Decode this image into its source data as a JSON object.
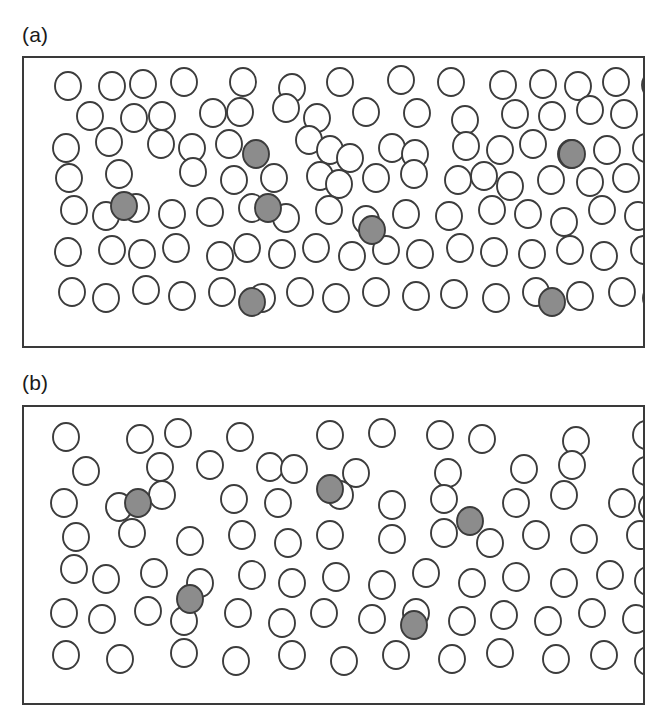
{
  "figure": {
    "background_color": "#ffffff",
    "width": 662,
    "height": 727
  },
  "style": {
    "open_circle_fill": "#ffffff",
    "filled_circle_fill": "#8c8c8c",
    "circle_stroke": "#3c3c3c",
    "frame_stroke": "#3a3a3a",
    "label_color": "#1a1a1a",
    "circle_radius_x": 13,
    "circle_radius_y": 14
  },
  "panels": [
    {
      "id": "panel-a",
      "label": "(a)",
      "label_x": 22,
      "label_y": 24,
      "frame": {
        "x": 22,
        "y": 56,
        "width": 623,
        "height": 292
      },
      "counts": {
        "open": 108,
        "filled": 6,
        "total": 114
      },
      "description": "High particle density field with six shaded particles"
    },
    {
      "id": "panel-b",
      "label": "(b)",
      "label_x": 22,
      "label_y": 372,
      "frame": {
        "x": 22,
        "y": 405,
        "width": 623,
        "height": 300
      },
      "counts": {
        "open": 80,
        "filled": 5,
        "total": 85
      },
      "description": "Lower particle density field with five shaded particles"
    }
  ],
  "chart_data": {
    "type": "scatter",
    "xlabel": "",
    "ylabel": "",
    "grid": false,
    "legend": null,
    "series": [
      {
        "name": "panel-a-open",
        "panel": "panel-a",
        "marker": "open-circle",
        "fill": "#ffffff",
        "stroke": "#3c3c3c",
        "points": [
          [
            44,
            28
          ],
          [
            88,
            28
          ],
          [
            119,
            26
          ],
          [
            160,
            24
          ],
          [
            219,
            24
          ],
          [
            268,
            30
          ],
          [
            316,
            24
          ],
          [
            377,
            22
          ],
          [
            427,
            24
          ],
          [
            479,
            27
          ],
          [
            519,
            26
          ],
          [
            554,
            28
          ],
          [
            592,
            24
          ],
          [
            631,
            27
          ],
          [
            66,
            58
          ],
          [
            110,
            60
          ],
          [
            138,
            58
          ],
          [
            189,
            55
          ],
          [
            216,
            54
          ],
          [
            262,
            50
          ],
          [
            293,
            60
          ],
          [
            342,
            54
          ],
          [
            393,
            55
          ],
          [
            441,
            62
          ],
          [
            491,
            56
          ],
          [
            528,
            58
          ],
          [
            566,
            52
          ],
          [
            600,
            56
          ],
          [
            636,
            60
          ],
          [
            42,
            90
          ],
          [
            85,
            84
          ],
          [
            137,
            86
          ],
          [
            168,
            90
          ],
          [
            205,
            86
          ],
          [
            232,
            96
          ],
          [
            285,
            82
          ],
          [
            306,
            92
          ],
          [
            326,
            100
          ],
          [
            368,
            90
          ],
          [
            391,
            96
          ],
          [
            442,
            88
          ],
          [
            476,
            92
          ],
          [
            509,
            86
          ],
          [
            547,
            96
          ],
          [
            583,
            92
          ],
          [
            622,
            90
          ],
          [
            45,
            120
          ],
          [
            95,
            116
          ],
          [
            169,
            114
          ],
          [
            210,
            122
          ],
          [
            250,
            120
          ],
          [
            296,
            118
          ],
          [
            315,
            126
          ],
          [
            352,
            120
          ],
          [
            390,
            116
          ],
          [
            434,
            122
          ],
          [
            460,
            118
          ],
          [
            486,
            128
          ],
          [
            527,
            122
          ],
          [
            566,
            124
          ],
          [
            602,
            120
          ],
          [
            636,
            126
          ],
          [
            50,
            152
          ],
          [
            82,
            158
          ],
          [
            112,
            150
          ],
          [
            148,
            156
          ],
          [
            186,
            154
          ],
          [
            228,
            150
          ],
          [
            262,
            160
          ],
          [
            305,
            152
          ],
          [
            342,
            162
          ],
          [
            382,
            156
          ],
          [
            425,
            158
          ],
          [
            468,
            152
          ],
          [
            504,
            156
          ],
          [
            540,
            164
          ],
          [
            578,
            152
          ],
          [
            614,
            158
          ],
          [
            638,
            162
          ],
          [
            44,
            194
          ],
          [
            88,
            192
          ],
          [
            118,
            196
          ],
          [
            152,
            190
          ],
          [
            196,
            198
          ],
          [
            223,
            190
          ],
          [
            258,
            196
          ],
          [
            292,
            190
          ],
          [
            328,
            198
          ],
          [
            362,
            192
          ],
          [
            396,
            196
          ],
          [
            436,
            190
          ],
          [
            470,
            194
          ],
          [
            508,
            196
          ],
          [
            546,
            192
          ],
          [
            580,
            198
          ],
          [
            620,
            192
          ],
          [
            48,
            234
          ],
          [
            82,
            240
          ],
          [
            122,
            232
          ],
          [
            158,
            238
          ],
          [
            198,
            234
          ],
          [
            238,
            240
          ],
          [
            276,
            234
          ],
          [
            312,
            240
          ],
          [
            352,
            234
          ],
          [
            392,
            238
          ],
          [
            430,
            236
          ],
          [
            472,
            240
          ],
          [
            512,
            234
          ],
          [
            556,
            238
          ],
          [
            598,
            234
          ],
          [
            632,
            240
          ]
        ]
      },
      {
        "name": "panel-a-filled",
        "panel": "panel-a",
        "marker": "filled-circle",
        "fill": "#8c8c8c",
        "stroke": "#3c3c3c",
        "points": [
          [
            232,
            96
          ],
          [
            100,
            148
          ],
          [
            244,
            150
          ],
          [
            348,
            172
          ],
          [
            228,
            244
          ],
          [
            548,
            96
          ],
          [
            528,
            244
          ]
        ]
      },
      {
        "name": "panel-b-open",
        "panel": "panel-b",
        "marker": "open-circle",
        "fill": "#ffffff",
        "stroke": "#3c3c3c",
        "points": [
          [
            42,
            30
          ],
          [
            116,
            32
          ],
          [
            154,
            26
          ],
          [
            216,
            30
          ],
          [
            306,
            28
          ],
          [
            358,
            26
          ],
          [
            416,
            28
          ],
          [
            458,
            32
          ],
          [
            552,
            34
          ],
          [
            622,
            28
          ],
          [
            62,
            64
          ],
          [
            136,
            60
          ],
          [
            186,
            58
          ],
          [
            246,
            60
          ],
          [
            270,
            62
          ],
          [
            332,
            66
          ],
          [
            424,
            66
          ],
          [
            500,
            62
          ],
          [
            548,
            58
          ],
          [
            622,
            64
          ],
          [
            40,
            96
          ],
          [
            95,
            100
          ],
          [
            138,
            88
          ],
          [
            210,
            92
          ],
          [
            254,
            96
          ],
          [
            316,
            88
          ],
          [
            368,
            98
          ],
          [
            420,
            92
          ],
          [
            492,
            96
          ],
          [
            540,
            88
          ],
          [
            598,
            96
          ],
          [
            628,
            100
          ],
          [
            52,
            130
          ],
          [
            108,
            126
          ],
          [
            166,
            134
          ],
          [
            218,
            128
          ],
          [
            264,
            136
          ],
          [
            306,
            128
          ],
          [
            368,
            132
          ],
          [
            420,
            126
          ],
          [
            466,
            136
          ],
          [
            512,
            128
          ],
          [
            560,
            132
          ],
          [
            616,
            128
          ],
          [
            50,
            162
          ],
          [
            82,
            172
          ],
          [
            130,
            166
          ],
          [
            176,
            176
          ],
          [
            228,
            168
          ],
          [
            268,
            176
          ],
          [
            312,
            170
          ],
          [
            358,
            178
          ],
          [
            402,
            166
          ],
          [
            448,
            176
          ],
          [
            492,
            170
          ],
          [
            540,
            176
          ],
          [
            586,
            168
          ],
          [
            624,
            174
          ],
          [
            40,
            206
          ],
          [
            78,
            212
          ],
          [
            124,
            204
          ],
          [
            160,
            214
          ],
          [
            214,
            206
          ],
          [
            258,
            216
          ],
          [
            300,
            206
          ],
          [
            348,
            212
          ],
          [
            392,
            206
          ],
          [
            438,
            214
          ],
          [
            480,
            208
          ],
          [
            524,
            214
          ],
          [
            568,
            206
          ],
          [
            612,
            212
          ],
          [
            42,
            248
          ],
          [
            96,
            252
          ],
          [
            160,
            246
          ],
          [
            212,
            254
          ],
          [
            268,
            248
          ],
          [
            320,
            254
          ],
          [
            372,
            248
          ],
          [
            428,
            252
          ],
          [
            476,
            246
          ],
          [
            532,
            252
          ],
          [
            580,
            248
          ],
          [
            624,
            254
          ]
        ]
      },
      {
        "name": "panel-b-filled",
        "panel": "panel-b",
        "marker": "filled-circle",
        "fill": "#8c8c8c",
        "stroke": "#3c3c3c",
        "points": [
          [
            114,
            96
          ],
          [
            306,
            82
          ],
          [
            446,
            114
          ],
          [
            166,
            192
          ],
          [
            390,
            218
          ]
        ]
      }
    ]
  }
}
